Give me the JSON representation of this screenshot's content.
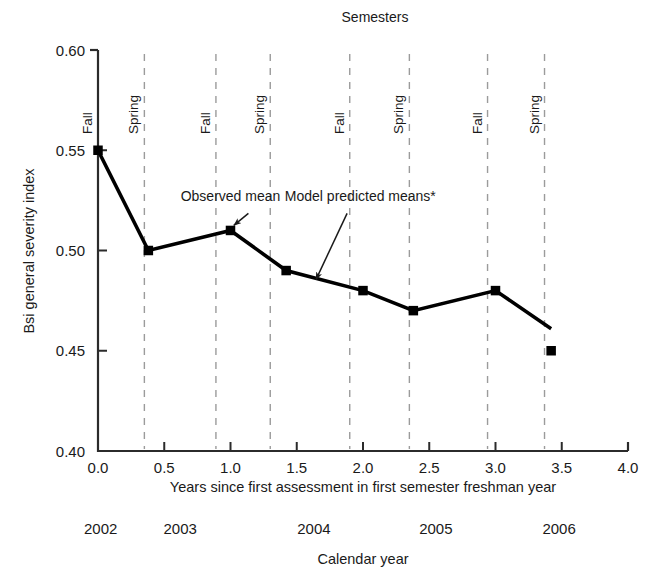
{
  "chart_data": {
    "type": "line",
    "title": "Semesters",
    "xlabel": "Years since first assessment in first semester freshman year",
    "ylabel": "Bsi general severity index",
    "secondary_xlabel": "Calendar year",
    "xlim": [
      0.0,
      4.0
    ],
    "ylim": [
      0.4,
      0.6
    ],
    "grid": false,
    "legend": "none",
    "x_ticks": [
      "0.0",
      "0.5",
      "1.0",
      "1.5",
      "2.0",
      "2.5",
      "3.0",
      "3.5",
      "4.0"
    ],
    "x_tick_values": [
      0.0,
      0.5,
      1.0,
      1.5,
      2.0,
      2.5,
      3.0,
      3.5,
      4.0
    ],
    "y_ticks": [
      "0.60",
      "0.55",
      "0.50",
      "0.45",
      "0.40"
    ],
    "y_tick_values": [
      0.6,
      0.55,
      0.5,
      0.45,
      0.4
    ],
    "series": [
      {
        "name": "Model predicted means",
        "marker": "square",
        "x": [
          0.0,
          0.38,
          1.0,
          1.42,
          2.0,
          2.38,
          3.0,
          3.42
        ],
        "values": [
          0.55,
          0.5,
          0.51,
          0.49,
          0.48,
          0.47,
          0.48,
          0.45
        ],
        "line_end": {
          "x": 3.42,
          "y": 0.461
        }
      }
    ],
    "semester_markers": [
      {
        "label": "Fall",
        "x": 0.0
      },
      {
        "label": "Spring",
        "x": 0.35
      },
      {
        "label": "Fall",
        "x": 0.89
      },
      {
        "label": "Spring",
        "x": 1.3
      },
      {
        "label": "Fall",
        "x": 1.9
      },
      {
        "label": "Spring",
        "x": 2.35
      },
      {
        "label": "Fall",
        "x": 2.94
      },
      {
        "label": "Spring",
        "x": 3.37
      }
    ],
    "calendar_years": [
      {
        "label": "2002",
        "x": 0.02
      },
      {
        "label": "2003",
        "x": 0.62
      },
      {
        "label": "2004",
        "x": 1.63
      },
      {
        "label": "2005",
        "x": 2.55
      },
      {
        "label": "2006",
        "x": 3.48
      }
    ],
    "annotations": [
      {
        "text": "Observed mean",
        "text_x": 1.0,
        "text_y": 0.5245,
        "arrow_from_x": 1.135,
        "arrow_from_y": 0.5185,
        "arrow_to_x": 1.025,
        "arrow_to_y": 0.5125
      },
      {
        "text": "Model predicted means*",
        "text_x": 1.98,
        "text_y": 0.5245,
        "arrow_from_x": 1.88,
        "arrow_from_y": 0.5185,
        "arrow_to_x": 1.645,
        "arrow_to_y": 0.4855
      }
    ]
  },
  "colors": {
    "axis": "#2b2b2b",
    "line": "#000000",
    "marker": "#000000",
    "gridline_dashed": "#9b9b9b",
    "text": "#1a1a1a"
  }
}
